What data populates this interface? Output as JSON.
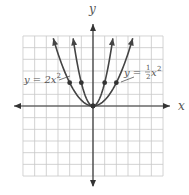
{
  "chart_data": {
    "type": "line",
    "title": "",
    "xlabel": "x",
    "ylabel": "y",
    "xlim": [
      -6,
      6
    ],
    "ylim": [
      -6,
      6
    ],
    "grid": true,
    "legend_position": "inline annotations",
    "series": [
      {
        "name": "y = 2x^2",
        "label": "y = 2x",
        "label_exp": "2",
        "coef": 2,
        "points": [
          [
            -1,
            2
          ],
          [
            0,
            0
          ],
          [
            1,
            2
          ]
        ],
        "color": "#444444"
      },
      {
        "name": "y = 1/2 x^2",
        "label_prefix": "y =",
        "label_num": "1",
        "label_den": "2",
        "label_var": "x",
        "label_exp": "2",
        "coef": 0.5,
        "points": [
          [
            -2,
            2
          ],
          [
            0,
            0
          ],
          [
            2,
            2
          ]
        ],
        "color": "#444444"
      }
    ]
  },
  "colors": {
    "grid": "#c8c8c8",
    "axis": "#333333",
    "curve": "#444444",
    "text": "#555555",
    "background": "#ffffff"
  }
}
